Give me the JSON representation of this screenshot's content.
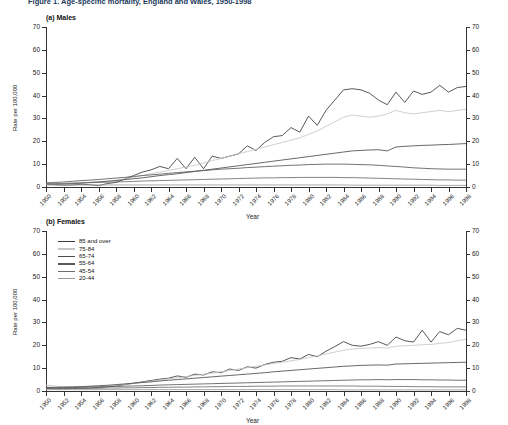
{
  "figure": {
    "title": "Figure 1. Age-specific mortality, England and Wales, 1950-1998",
    "title_clipped": true
  },
  "panels": [
    {
      "id": "males",
      "label": "(a) Males"
    },
    {
      "id": "females",
      "label": "(b) Females"
    }
  ],
  "axes": {
    "ylabel": "Rate per 100,000",
    "xlabel": "Year",
    "yticks": [
      0,
      10,
      20,
      30,
      40,
      50,
      60,
      70
    ],
    "ylim": [
      0,
      70
    ],
    "xticks": [
      "1950",
      "1952",
      "1954",
      "1956",
      "1958",
      "1960",
      "1962",
      "1964",
      "1966",
      "1968",
      "1970",
      "1972",
      "1974",
      "1976",
      "1978",
      "1980",
      "1982",
      "1984",
      "1986",
      "1988",
      "1990",
      "1992",
      "1994",
      "1996",
      "1998"
    ]
  },
  "legend": {
    "position": "top-left of females panel",
    "entries": [
      {
        "label": "85 and over",
        "color": "#3a3a3a"
      },
      {
        "label": "75-84",
        "color": "#c6c6c6"
      },
      {
        "label": "65-74",
        "color": "#4d4d4d"
      },
      {
        "label": "55-64",
        "color": "#5a5a5a"
      },
      {
        "label": "45-54",
        "color": "#6e6e6e"
      },
      {
        "label": "20-44",
        "color": "#9a9a9a"
      }
    ]
  },
  "chart_data": [
    {
      "type": "line",
      "title": "(a) Males",
      "xlabel": "Year",
      "ylabel": "Rate per 100,000",
      "ylim": [
        0,
        70
      ],
      "grid": false,
      "legend_position": "none",
      "x": [
        1950,
        1951,
        1952,
        1953,
        1954,
        1955,
        1956,
        1957,
        1958,
        1959,
        1960,
        1961,
        1962,
        1963,
        1964,
        1965,
        1966,
        1967,
        1968,
        1969,
        1970,
        1971,
        1972,
        1973,
        1974,
        1975,
        1976,
        1977,
        1978,
        1979,
        1980,
        1981,
        1982,
        1983,
        1984,
        1985,
        1986,
        1987,
        1988,
        1989,
        1990,
        1991,
        1992,
        1993,
        1994,
        1995,
        1996,
        1997,
        1998
      ],
      "series": [
        {
          "name": "85 and over",
          "color": "#3a3a3a",
          "values": [
            1.5,
            1.0,
            0.8,
            0.9,
            1.2,
            1.0,
            0.6,
            1.5,
            2.0,
            3.5,
            5.0,
            6.5,
            7.5,
            9.0,
            8.0,
            12.5,
            8.0,
            13.0,
            8.0,
            13.5,
            12.5,
            13.5,
            14.5,
            18.0,
            16.0,
            19.5,
            22.0,
            22.5,
            26.0,
            24.0,
            31.0,
            27.0,
            33.5,
            38.0,
            42.5,
            43.0,
            42.5,
            41.0,
            38.0,
            36.0,
            41.5,
            37.0,
            42.0,
            40.5,
            41.5,
            44.5,
            41.5,
            43.5,
            44.0
          ]
        },
        {
          "name": "75-84",
          "color": "#c6c6c6",
          "values": [
            1.2,
            1.3,
            1.4,
            1.6,
            1.8,
            2.0,
            2.3,
            2.6,
            3.0,
            3.5,
            4.2,
            5.0,
            5.8,
            6.5,
            7.2,
            8.0,
            8.8,
            9.5,
            10.5,
            11.5,
            12.5,
            13.5,
            14.5,
            15.5,
            16.5,
            17.5,
            18.5,
            19.5,
            20.5,
            21.5,
            23.0,
            24.5,
            26.5,
            28.5,
            30.5,
            31.5,
            31.0,
            30.5,
            31.0,
            32.0,
            33.5,
            32.5,
            32.0,
            32.5,
            33.0,
            33.5,
            33.0,
            33.5,
            34.0
          ]
        },
        {
          "name": "65-74",
          "color": "#4d4d4d",
          "values": [
            1.0,
            1.1,
            1.3,
            1.5,
            1.7,
            2.0,
            2.2,
            2.5,
            2.8,
            3.2,
            3.6,
            4.0,
            4.5,
            5.0,
            5.4,
            5.8,
            6.3,
            6.8,
            7.3,
            7.8,
            8.3,
            8.8,
            9.3,
            9.8,
            10.3,
            10.8,
            11.3,
            11.8,
            12.3,
            12.8,
            13.3,
            13.8,
            14.3,
            14.8,
            15.3,
            15.8,
            16.0,
            16.2,
            16.3,
            15.8,
            17.5,
            17.8,
            18.0,
            18.2,
            18.3,
            18.5,
            18.6,
            18.8,
            19.0
          ]
        },
        {
          "name": "55-64",
          "color": "#5a5a5a",
          "values": [
            1.8,
            2.0,
            2.2,
            2.5,
            2.8,
            3.0,
            3.3,
            3.6,
            3.9,
            4.2,
            4.6,
            5.0,
            5.3,
            5.6,
            6.0,
            6.3,
            6.6,
            6.9,
            7.2,
            7.5,
            7.8,
            8.0,
            8.2,
            8.5,
            8.7,
            8.9,
            9.1,
            9.3,
            9.5,
            9.6,
            9.8,
            9.9,
            10.0,
            10.0,
            10.0,
            9.9,
            9.8,
            9.7,
            9.5,
            9.2,
            9.0,
            8.7,
            8.4,
            8.2,
            8.0,
            7.9,
            7.8,
            7.8,
            7.8
          ]
        },
        {
          "name": "45-54",
          "color": "#6e6e6e",
          "values": [
            1.4,
            1.5,
            1.6,
            1.7,
            1.8,
            1.9,
            2.0,
            2.1,
            2.2,
            2.3,
            2.4,
            2.6,
            2.7,
            2.8,
            2.9,
            3.0,
            3.1,
            3.2,
            3.3,
            3.4,
            3.5,
            3.6,
            3.7,
            3.8,
            3.9,
            4.0,
            4.0,
            4.1,
            4.1,
            4.2,
            4.2,
            4.2,
            4.2,
            4.2,
            4.1,
            4.1,
            4.0,
            3.9,
            3.8,
            3.7,
            3.6,
            3.5,
            3.4,
            3.3,
            3.2,
            3.1,
            3.1,
            3.0,
            3.0
          ]
        },
        {
          "name": "20-44",
          "color": "#9a9a9a",
          "values": [
            0.9,
            0.9,
            0.9,
            0.9,
            0.9,
            0.9,
            0.9,
            0.9,
            0.9,
            0.9,
            0.9,
            0.9,
            0.9,
            0.9,
            0.9,
            0.9,
            0.9,
            0.9,
            0.9,
            0.9,
            0.9,
            0.9,
            0.9,
            0.9,
            0.9,
            0.9,
            0.9,
            0.9,
            0.9,
            0.9,
            0.9,
            0.9,
            0.9,
            0.9,
            0.9,
            0.8,
            0.8,
            0.8,
            0.8,
            0.8,
            0.8,
            0.8,
            0.8,
            0.8,
            0.8,
            0.7,
            0.7,
            0.7,
            0.7
          ]
        }
      ]
    },
    {
      "type": "line",
      "title": "(b) Females",
      "xlabel": "Year",
      "ylabel": "Rate per 100,000",
      "ylim": [
        0,
        70
      ],
      "grid": false,
      "legend_position": "upper-left",
      "x": [
        1950,
        1951,
        1952,
        1953,
        1954,
        1955,
        1956,
        1957,
        1958,
        1959,
        1960,
        1961,
        1962,
        1963,
        1964,
        1965,
        1966,
        1967,
        1968,
        1969,
        1970,
        1971,
        1972,
        1973,
        1974,
        1975,
        1976,
        1977,
        1978,
        1979,
        1980,
        1981,
        1982,
        1983,
        1984,
        1985,
        1986,
        1987,
        1988,
        1989,
        1990,
        1991,
        1992,
        1993,
        1994,
        1995,
        1996,
        1997,
        1998
      ],
      "series": [
        {
          "name": "85 and over",
          "color": "#3a3a3a",
          "values": [
            1.2,
            1.0,
            1.0,
            1.1,
            1.2,
            1.3,
            1.5,
            1.8,
            2.2,
            2.8,
            3.4,
            4.0,
            4.6,
            5.2,
            5.6,
            6.6,
            6.0,
            7.4,
            7.0,
            8.4,
            8.0,
            9.6,
            9.0,
            10.6,
            10.0,
            11.6,
            12.6,
            13.0,
            14.6,
            14.0,
            16.0,
            15.0,
            17.4,
            19.4,
            21.6,
            20.0,
            19.6,
            20.4,
            21.6,
            20.0,
            23.6,
            22.0,
            21.4,
            26.6,
            21.4,
            26.0,
            24.6,
            27.4,
            26.6
          ]
        },
        {
          "name": "75-84",
          "color": "#c6c6c6",
          "values": [
            2.6,
            2.2,
            1.9,
            1.8,
            1.8,
            1.9,
            2.0,
            2.2,
            2.5,
            2.9,
            3.3,
            3.8,
            4.3,
            4.8,
            5.3,
            5.8,
            6.3,
            6.8,
            7.3,
            7.8,
            8.4,
            9.0,
            9.6,
            10.2,
            10.8,
            11.4,
            12.0,
            12.6,
            13.2,
            13.8,
            14.6,
            15.4,
            16.2,
            17.0,
            17.8,
            18.4,
            18.6,
            18.8,
            19.0,
            18.8,
            19.6,
            19.8,
            20.0,
            20.2,
            20.4,
            20.8,
            21.2,
            22.0,
            22.6
          ]
        },
        {
          "name": "65-74",
          "color": "#4d4d4d",
          "values": [
            1.6,
            1.6,
            1.7,
            1.8,
            1.9,
            2.1,
            2.3,
            2.5,
            2.8,
            3.1,
            3.4,
            3.7,
            4.0,
            4.4,
            4.7,
            5.0,
            5.3,
            5.6,
            5.9,
            6.2,
            6.5,
            6.8,
            7.1,
            7.4,
            7.7,
            8.0,
            8.4,
            8.7,
            9.0,
            9.3,
            9.6,
            9.9,
            10.2,
            10.5,
            10.8,
            11.0,
            11.2,
            11.3,
            11.4,
            11.3,
            11.8,
            11.9,
            12.0,
            12.1,
            12.2,
            12.3,
            12.4,
            12.5,
            12.6
          ]
        },
        {
          "name": "55-64",
          "color": "#5a5a5a",
          "values": [
            1.4,
            1.4,
            1.5,
            1.5,
            1.6,
            1.7,
            1.8,
            1.9,
            2.0,
            2.1,
            2.2,
            2.3,
            2.4,
            2.6,
            2.7,
            2.8,
            2.9,
            3.0,
            3.1,
            3.2,
            3.3,
            3.4,
            3.5,
            3.6,
            3.7,
            3.8,
            3.9,
            4.0,
            4.1,
            4.2,
            4.3,
            4.4,
            4.5,
            4.6,
            4.7,
            4.8,
            4.9,
            4.9,
            5.0,
            4.9,
            5.0,
            5.0,
            5.0,
            4.9,
            4.9,
            4.8,
            4.8,
            4.7,
            4.7
          ]
        },
        {
          "name": "45-54",
          "color": "#6e6e6e",
          "values": [
            1.0,
            1.0,
            1.0,
            1.1,
            1.1,
            1.2,
            1.2,
            1.3,
            1.3,
            1.4,
            1.4,
            1.5,
            1.5,
            1.6,
            1.6,
            1.7,
            1.7,
            1.8,
            1.8,
            1.9,
            1.9,
            2.0,
            2.0,
            2.0,
            2.1,
            2.1,
            2.1,
            2.2,
            2.2,
            2.2,
            2.2,
            2.2,
            2.2,
            2.2,
            2.2,
            2.2,
            2.1,
            2.1,
            2.1,
            2.0,
            2.0,
            2.0,
            1.9,
            1.9,
            1.9,
            1.8,
            1.8,
            1.8,
            1.8
          ]
        },
        {
          "name": "20-44",
          "color": "#9a9a9a",
          "values": [
            0.6,
            0.6,
            0.6,
            0.6,
            0.6,
            0.6,
            0.6,
            0.6,
            0.6,
            0.6,
            0.6,
            0.6,
            0.6,
            0.6,
            0.6,
            0.6,
            0.6,
            0.6,
            0.6,
            0.6,
            0.6,
            0.6,
            0.6,
            0.6,
            0.6,
            0.6,
            0.6,
            0.6,
            0.6,
            0.6,
            0.6,
            0.6,
            0.6,
            0.6,
            0.5,
            0.5,
            0.5,
            0.5,
            0.5,
            0.5,
            0.5,
            0.5,
            0.5,
            0.5,
            0.5,
            0.5,
            0.5,
            0.5,
            0.5
          ]
        }
      ]
    }
  ]
}
